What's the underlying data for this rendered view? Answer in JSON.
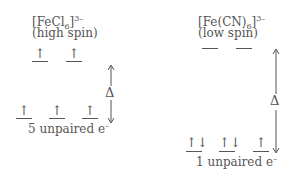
{
  "left": {
    "formula_base": "[FeCl",
    "formula_sub": "6",
    "formula_close": "]",
    "formula_charge": "3–",
    "spin_label": "(high spin)",
    "upper_orbitals": [
      "↑",
      "↑"
    ],
    "lower_orbitals": [
      "↑",
      "↑",
      "↑"
    ],
    "caption_number": "5 unpaired e",
    "caption_sup": "–",
    "gap_label": "Δ"
  },
  "right": {
    "formula_base": "[Fe(CN)",
    "formula_sub": "6",
    "formula_close": "]",
    "formula_charge": "3–",
    "spin_label": "(low spin)",
    "upper_orbitals": [
      "",
      ""
    ],
    "lower_orbitals": [
      "↑↓",
      "↑↓",
      "↑"
    ],
    "caption_number": "1 unpaired e",
    "caption_sup": "–",
    "gap_label": "Δ"
  }
}
